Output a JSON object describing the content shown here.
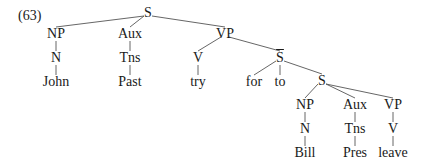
{
  "example_number": "(63)",
  "nodes": [
    {
      "id": "S1",
      "label": "S",
      "x": 148,
      "y": 13
    },
    {
      "id": "NP1",
      "label": "NP",
      "x": 56,
      "y": 34
    },
    {
      "id": "Aux1",
      "label": "Aux",
      "x": 130,
      "y": 34
    },
    {
      "id": "VP1",
      "label": "VP",
      "x": 225,
      "y": 34
    },
    {
      "id": "N1",
      "label": "N",
      "x": 56,
      "y": 58
    },
    {
      "id": "Tns1",
      "label": "Tns",
      "x": 130,
      "y": 58
    },
    {
      "id": "V1",
      "label": "V",
      "x": 198,
      "y": 58
    },
    {
      "id": "John",
      "label": "John",
      "x": 56,
      "y": 82
    },
    {
      "id": "Past",
      "label": "Past",
      "x": 130,
      "y": 82
    },
    {
      "id": "try",
      "label": "try",
      "x": 198,
      "y": 82
    },
    {
      "id": "Sbar",
      "label": "S",
      "x": 280,
      "y": 58,
      "overbar": true
    },
    {
      "id": "for",
      "label": "for",
      "x": 254,
      "y": 82
    },
    {
      "id": "to",
      "label": "to",
      "x": 280,
      "y": 82
    },
    {
      "id": "S2",
      "label": "S",
      "x": 322,
      "y": 81
    },
    {
      "id": "NP2",
      "label": "NP",
      "x": 305,
      "y": 105
    },
    {
      "id": "Aux2",
      "label": "Aux",
      "x": 355,
      "y": 105
    },
    {
      "id": "VP2",
      "label": "VP",
      "x": 393,
      "y": 105
    },
    {
      "id": "N2",
      "label": "N",
      "x": 305,
      "y": 129
    },
    {
      "id": "Tns2",
      "label": "Tns",
      "x": 355,
      "y": 129
    },
    {
      "id": "V2",
      "label": "V",
      "x": 393,
      "y": 129
    },
    {
      "id": "Bill",
      "label": "Bill",
      "x": 305,
      "y": 153
    },
    {
      "id": "Pres",
      "label": "Pres",
      "x": 355,
      "y": 153
    },
    {
      "id": "leave",
      "label": "leave",
      "x": 393,
      "y": 153
    }
  ],
  "edges": [
    [
      "S1",
      "NP1"
    ],
    [
      "S1",
      "Aux1"
    ],
    [
      "S1",
      "VP1"
    ],
    [
      "NP1",
      "N1"
    ],
    [
      "N1",
      "John"
    ],
    [
      "Aux1",
      "Tns1"
    ],
    [
      "Tns1",
      "Past"
    ],
    [
      "VP1",
      "V1"
    ],
    [
      "V1",
      "try"
    ],
    [
      "VP1",
      "Sbar"
    ],
    [
      "Sbar",
      "for"
    ],
    [
      "Sbar",
      "to"
    ],
    [
      "Sbar",
      "S2"
    ],
    [
      "S2",
      "NP2"
    ],
    [
      "S2",
      "Aux2"
    ],
    [
      "S2",
      "VP2"
    ],
    [
      "NP2",
      "N2"
    ],
    [
      "N2",
      "Bill"
    ],
    [
      "Aux2",
      "Tns2"
    ],
    [
      "Tns2",
      "Pres"
    ],
    [
      "VP2",
      "V2"
    ],
    [
      "V2",
      "leave"
    ]
  ]
}
